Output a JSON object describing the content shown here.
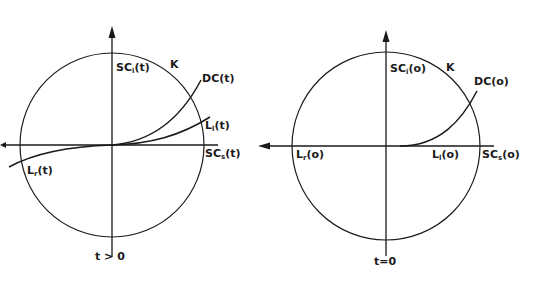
{
  "colors": {
    "stroke": "#1a1a1a",
    "background": "#ffffff"
  },
  "left_panel": {
    "circle_label": "K",
    "vertical_axis": {
      "base": "SC",
      "sub": "i",
      "arg": "(t)"
    },
    "horizontal_axis": {
      "base": "SC",
      "sub": "s",
      "arg": "(t)"
    },
    "curve_dc": "DC(t)",
    "curve_ll": {
      "base": "L",
      "sub": "l",
      "arg": "(t)"
    },
    "curve_lr": {
      "base": "L",
      "sub": "r",
      "arg": "(t)"
    },
    "time_label": "t > 0"
  },
  "right_panel": {
    "circle_label": "K",
    "vertical_axis": {
      "base": "SC",
      "sub": "i",
      "arg": "(o)"
    },
    "horizontal_axis": {
      "base": "SC",
      "sub": "s",
      "arg": "(o)"
    },
    "curve_dc": "DC(o)",
    "curve_ll": {
      "base": "L",
      "sub": "l",
      "arg": "(o)"
    },
    "curve_lr": {
      "base": "L",
      "sub": "r",
      "arg": "(o)"
    },
    "time_label": "t=0"
  }
}
